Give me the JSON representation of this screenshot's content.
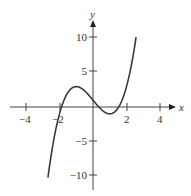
{
  "chart_data": {
    "type": "line",
    "title": "",
    "xlabel": "x",
    "ylabel": "y",
    "xlim": [
      -5,
      5
    ],
    "ylim": [
      -12,
      12
    ],
    "x_ticks": [
      -4,
      -2,
      2,
      4
    ],
    "x_tick_labels": [
      "−4",
      "−2",
      "2",
      "4"
    ],
    "y_ticks": [
      10,
      5,
      -5,
      -10
    ],
    "y_tick_labels": [
      "10",
      "5",
      "−5",
      "−10"
    ],
    "grid": false,
    "legend": null,
    "series": [
      {
        "name": "f(x) = x^3 - 3x + 1",
        "domain": [
          -2.69,
          2.57
        ],
        "x": [
          -2.69,
          -2.5,
          -2.0,
          -1.5,
          -1.0,
          -0.5,
          0.0,
          0.5,
          1.0,
          1.5,
          2.0,
          2.57
        ],
        "y": [
          -10.4,
          -7.1,
          -1.0,
          2.1,
          3.0,
          2.4,
          1.0,
          -0.4,
          -1.0,
          -0.1,
          3.0,
          10.3
        ]
      }
    ],
    "annotations": {
      "local_max": [
        -1,
        3
      ],
      "local_min": [
        1,
        -1
      ]
    },
    "colors": {
      "curve": "#3a3a3a",
      "axes": "#444444",
      "text": "#333333"
    }
  }
}
